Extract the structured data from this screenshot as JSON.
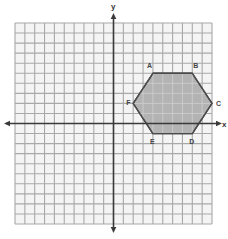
{
  "diagram": {
    "type": "coordinate-plane",
    "grid": {
      "x_min": -10,
      "x_max": 10,
      "y_min": -10,
      "y_max": 10,
      "step": 1
    },
    "axes": {
      "x_label": "x",
      "y_label": "y"
    },
    "colors": {
      "grid_line": "#a8a8a8",
      "grid_background": "#f4f4f4",
      "axis": "#3a3a3a",
      "polygon_fill": "#b3b3b3",
      "polygon_stroke": "#4a4a4a",
      "label": "#444444"
    },
    "polygon": {
      "name": "hexagon ABCDEF",
      "vertices": [
        {
          "label": "A",
          "x": 4,
          "y": 5
        },
        {
          "label": "B",
          "x": 8,
          "y": 5
        },
        {
          "label": "C",
          "x": 10,
          "y": 2
        },
        {
          "label": "D",
          "x": 8,
          "y": -1
        },
        {
          "label": "E",
          "x": 4,
          "y": -1
        },
        {
          "label": "F",
          "x": 2,
          "y": 2
        }
      ]
    }
  }
}
